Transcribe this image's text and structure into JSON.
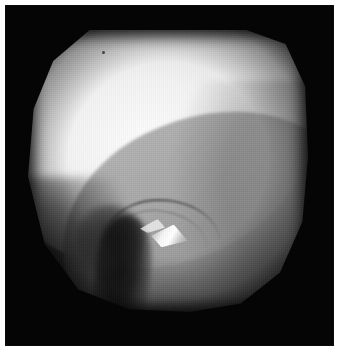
{
  "page": {
    "background_color": "#ffffff",
    "width": 344,
    "height": 357
  },
  "frame": {
    "background_color": "#050505",
    "x": 5,
    "y": 5,
    "width": 329,
    "height": 341
  },
  "image": {
    "kind": "arthroscopy-photograph",
    "modality": "knee arthroscopy",
    "view": "intercondylar notch",
    "field_of_view_shape": "truncated-circle",
    "field_of_view": {
      "x": 28,
      "y": 30,
      "width": 280,
      "height": 282
    },
    "palette": {
      "background": "#050505",
      "highlight": "#fcfcfc",
      "bright_tissue": "#e8e8e8",
      "mid_tissue": "#a8a8a8",
      "shadow_tissue": "#4a4a4a",
      "deep_shadow": "#0a0a0a"
    },
    "features": [
      {
        "name": "medial-femoral-condyle",
        "description": "large bright convex dome occupying the upper-left two thirds of the field",
        "tone": "bright"
      },
      {
        "name": "tibial-plateau-band",
        "description": "mid-grey band running diagonally from upper-right toward lower-left",
        "tone": "mid"
      },
      {
        "name": "intercondylar-notch-shadow",
        "description": "dark vertical recess low in the centre of the field",
        "tone": "dark"
      },
      {
        "name": "ligament-fold",
        "description": "thin curved dark line arcing to the right of the notch",
        "tone": "dark-line"
      },
      {
        "name": "specular-highlight",
        "description": "small bright triangular glint on the moist ligament surface",
        "tone": "specular"
      },
      {
        "name": "debris-speck",
        "description": "tiny dark dot near the upper-left margin of the condyle",
        "tone": "dark-point"
      }
    ]
  }
}
